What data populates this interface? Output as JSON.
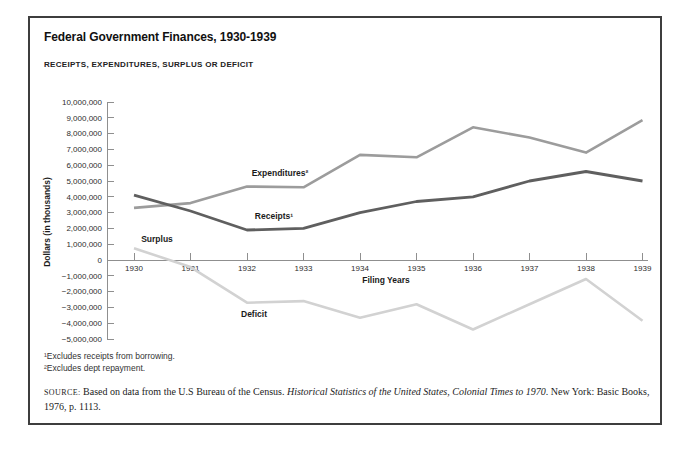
{
  "header": {
    "title": "Federal Government Finances, 1930-1939",
    "subtitle": "RECEIPTS, EXPENDITURES, SURPLUS OR DEFICIT"
  },
  "chart_data": {
    "type": "line",
    "title": "Federal Government Finances, 1930-1939",
    "subtitle": "RECEIPTS, EXPENDITURES, SURPLUS OR DEFICIT",
    "xlabel": "Filing Years",
    "ylabel": "Dollars (in thousands)",
    "categories": [
      "1930",
      "1931",
      "1932",
      "1933",
      "1934",
      "1935",
      "1936",
      "1937",
      "1938",
      "1939"
    ],
    "ylim": [
      -5000000,
      10000000
    ],
    "y_tick_interval": 1000000,
    "y_tick_labels": [
      "10,000,000",
      "9,000,000",
      "8,000,000",
      "7,000,000",
      "6,000,000",
      "5,000,000",
      "4,000,000",
      "3,000,000",
      "2,000,000",
      "1,000,000",
      "0",
      "−1,000,000",
      "−2,000,000",
      "−3,000,000",
      "−4,000,000",
      "−5,000,000"
    ],
    "grid": false,
    "legend_position": "inline-labels",
    "series": [
      {
        "name": "Expenditures",
        "label": "Expenditures²",
        "color": "#9c9c9c",
        "values": [
          3300000,
          3600000,
          4650000,
          4600000,
          6650000,
          6500000,
          8400000,
          7750000,
          6800000,
          8850000
        ]
      },
      {
        "name": "Receipts",
        "label": "Receipts¹",
        "color": "#5f5f5f",
        "values": [
          4100000,
          3100000,
          1900000,
          2000000,
          3000000,
          3700000,
          4000000,
          5000000,
          5600000,
          5000000
        ]
      },
      {
        "name": "Surplus or Deficit",
        "labels": [
          "Surplus",
          "Deficit"
        ],
        "color": "#d2d2d2",
        "values": [
          750000,
          -450000,
          -2700000,
          -2600000,
          -3650000,
          -2800000,
          -4400000,
          -2800000,
          -1200000,
          -3850000
        ]
      }
    ]
  },
  "footnotes": [
    "¹Excludes receipts from borrowing.",
    "²Excludes dept repayment."
  ],
  "source": {
    "label": "SOURCE:",
    "before_title": "Based on data from the U.S Bureau of the Census. ",
    "title_italic": "Historical Statistics of the United States, Colonial Times to 1970",
    "after_title": ". New York: Basic Books, 1976, p. 1113."
  }
}
